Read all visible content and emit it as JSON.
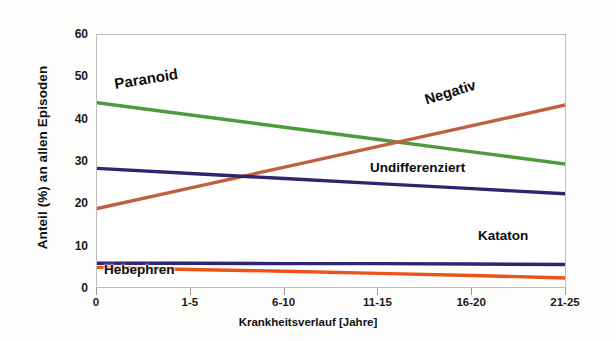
{
  "chart_data": {
    "type": "line",
    "title": "",
    "xlabel": "Krankheitsverlauf [Jahre]",
    "ylabel": "Anteil (%) an allen Episoden",
    "categories": [
      "0",
      "1-5",
      "6-10",
      "11-15",
      "16-20",
      "21-25"
    ],
    "ylim": [
      0,
      60
    ],
    "yticks": [
      0,
      10,
      20,
      30,
      40,
      50,
      60
    ],
    "grid": false,
    "legend": "inline-annotations",
    "series": [
      {
        "name": "Paranoid",
        "color": "#4e9a3f",
        "values": [
          44.0,
          41.1,
          38.2,
          35.3,
          32.4,
          29.5
        ]
      },
      {
        "name": "Negativ",
        "color": "#c0603f",
        "values": [
          19.0,
          23.9,
          28.8,
          33.7,
          38.6,
          43.5
        ]
      },
      {
        "name": "Undifferenziert",
        "color": "#33246e",
        "values": [
          28.5,
          27.3,
          26.1,
          24.9,
          23.7,
          22.5
        ]
      },
      {
        "name": "Kataton",
        "color": "#2e2670",
        "values": [
          6.1,
          6.1,
          6.0,
          6.0,
          5.9,
          5.8
        ]
      },
      {
        "name": "Hebephren",
        "color": "#ea5418",
        "values": [
          5.1,
          4.6,
          4.2,
          3.7,
          3.2,
          2.6
        ]
      }
    ]
  },
  "axes": {
    "y_tick_labels": [
      "60",
      "50",
      "40",
      "30",
      "20",
      "10",
      "0"
    ],
    "x_tick_labels": [
      "0",
      "1-5",
      "6-10",
      "11-15",
      "16-20",
      "21-25"
    ],
    "x_axis_title": "Krankheitsverlauf [Jahre]",
    "y_axis_title": "Anteil (%) an allen Episoden"
  },
  "annotations": {
    "paranoid": "Paranoid",
    "negativ": "Negativ",
    "undifferenziert": "Undifferenziert",
    "kataton": "Kataton",
    "hebephren": "Hebephren"
  }
}
